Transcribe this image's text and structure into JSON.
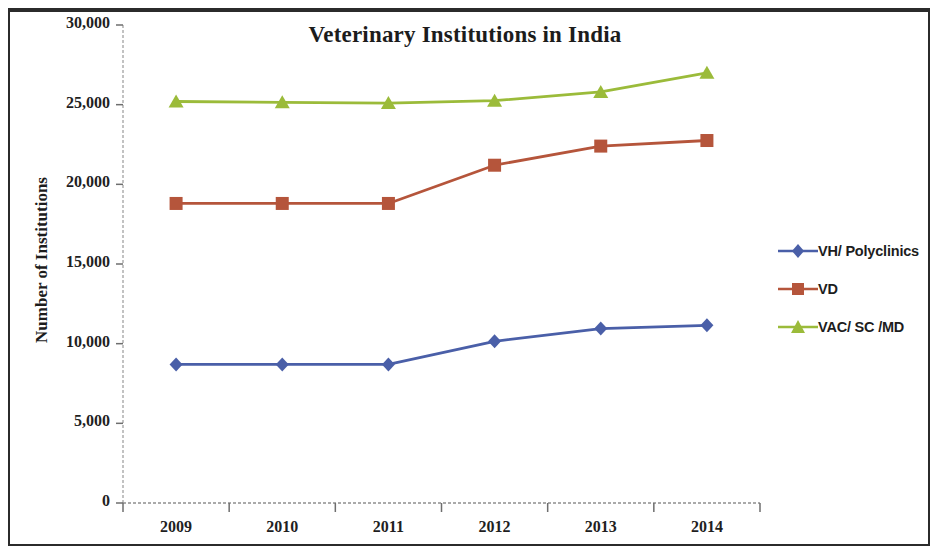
{
  "figure": {
    "title": "Veterinary Institutions in India"
  },
  "legend": {
    "position": "right",
    "items": [
      {
        "label": "VH/ Polyclinics",
        "marker": "diamond-marker",
        "color": "#4a5fa8"
      },
      {
        "label": "VD",
        "marker": "square-marker",
        "color": "#b5553b"
      },
      {
        "label": "VAC/ SC /MD",
        "marker": "triangle-marker",
        "color": "#9bbb3a"
      }
    ]
  },
  "chart_data": {
    "type": "line",
    "title": "Veterinary Institutions in India",
    "xlabel": "",
    "ylabel": "Number of Institutions",
    "categories": [
      "2009",
      "2010",
      "2011",
      "2012",
      "2013",
      "2014"
    ],
    "ylim": [
      0,
      30000
    ],
    "ytick_labels": [
      "30,000",
      "25,000",
      "20,000",
      "15,000",
      "10,000",
      "5,000",
      "0"
    ],
    "ytick_values": [
      30000,
      25000,
      20000,
      15000,
      10000,
      5000,
      0
    ],
    "ytick_step": 5000,
    "grid": false,
    "series": [
      {
        "name": "VH/ Polyclinics",
        "color": "#4a5fa8",
        "marker": "diamond",
        "values": [
          8700,
          8700,
          8700,
          10150,
          10950,
          11150
        ]
      },
      {
        "name": "VD",
        "color": "#b5553b",
        "marker": "square",
        "values": [
          18800,
          18800,
          18800,
          21200,
          22400,
          22750
        ]
      },
      {
        "name": "VAC/ SC /MD",
        "color": "#9bbb3a",
        "marker": "triangle",
        "values": [
          25200,
          25150,
          25100,
          25250,
          25800,
          27000
        ]
      }
    ]
  }
}
